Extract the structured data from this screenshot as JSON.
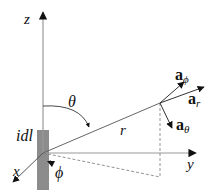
{
  "diagram": {
    "axes": {
      "z": "z",
      "y": "y",
      "x": "x"
    },
    "labels": {
      "current_element": "idl",
      "radius": "r",
      "theta": "θ",
      "phi": "ϕ"
    },
    "unit_vectors": {
      "a_r": {
        "base": "a",
        "sub": "r"
      },
      "a_theta": {
        "base": "a",
        "sub": "θ"
      },
      "a_phi": {
        "base": "a",
        "sub": "ϕ"
      }
    },
    "colors": {
      "axis": "#999999",
      "element_bar": "#8c8c8c",
      "ink": "#111111"
    }
  }
}
